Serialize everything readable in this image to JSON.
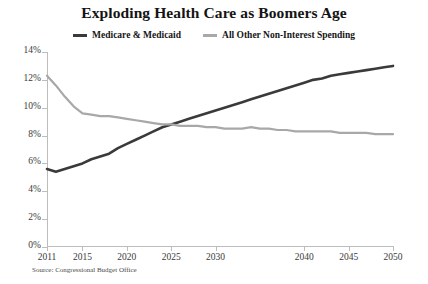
{
  "chart_data": {
    "type": "line",
    "title": "Exploding Health Care as Boomers Age",
    "xlabel": "",
    "ylabel": "",
    "source": "Source: Congressional Budget Office",
    "xlim": [
      2011,
      2050
    ],
    "ylim": [
      0,
      14
    ],
    "grid": false,
    "legend_position": "top-center",
    "ytick_labels": [
      "0%",
      "2%",
      "4%",
      "6%",
      "8%",
      "10%",
      "12%",
      "14%"
    ],
    "ytick_values": [
      0,
      2,
      4,
      6,
      8,
      10,
      12,
      14
    ],
    "xtick_labels": [
      "2011",
      "2015",
      "2020",
      "2025",
      "2030",
      "2040",
      "2045",
      "2050"
    ],
    "xtick_values": [
      2011,
      2015,
      2020,
      2025,
      2030,
      2040,
      2045,
      2050
    ],
    "x": [
      2011,
      2012,
      2013,
      2014,
      2015,
      2016,
      2017,
      2018,
      2019,
      2020,
      2021,
      2022,
      2023,
      2024,
      2025,
      2026,
      2027,
      2028,
      2029,
      2030,
      2031,
      2032,
      2033,
      2034,
      2035,
      2036,
      2037,
      2038,
      2039,
      2040,
      2041,
      2042,
      2043,
      2044,
      2045,
      2046,
      2047,
      2048,
      2049,
      2050
    ],
    "series": [
      {
        "name": "Medicare & Medicaid",
        "color": "#3a3a3a",
        "values": [
          5.6,
          5.4,
          5.6,
          5.8,
          6.0,
          6.3,
          6.5,
          6.7,
          7.1,
          7.4,
          7.7,
          8.0,
          8.3,
          8.6,
          8.8,
          9.0,
          9.2,
          9.4,
          9.6,
          9.8,
          10.0,
          10.2,
          10.4,
          10.6,
          10.8,
          11.0,
          11.2,
          11.4,
          11.6,
          11.8,
          12.0,
          12.1,
          12.3,
          12.4,
          12.5,
          12.6,
          12.7,
          12.8,
          12.9,
          13.0
        ]
      },
      {
        "name": "All Other Non-Interest Spending",
        "color": "#a8a8a8",
        "values": [
          12.3,
          11.6,
          10.8,
          10.1,
          9.6,
          9.5,
          9.4,
          9.4,
          9.3,
          9.2,
          9.1,
          9.0,
          8.9,
          8.8,
          8.8,
          8.7,
          8.7,
          8.7,
          8.6,
          8.6,
          8.5,
          8.5,
          8.5,
          8.6,
          8.5,
          8.5,
          8.4,
          8.4,
          8.3,
          8.3,
          8.3,
          8.3,
          8.3,
          8.2,
          8.2,
          8.2,
          8.2,
          8.1,
          8.1,
          8.1
        ]
      }
    ]
  }
}
